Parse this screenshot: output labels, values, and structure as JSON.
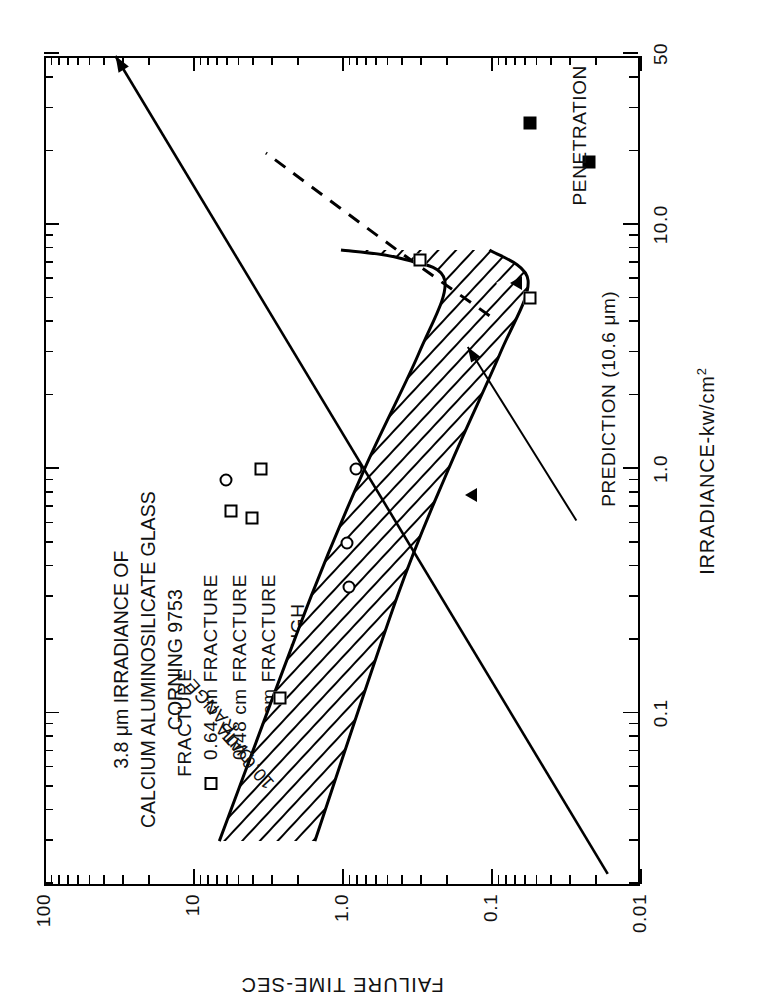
{
  "figure": {
    "title_lines": [
      "3.8 μm IRRADIANCE OF",
      "CALCIUM ALUMINOSILICATE GLASS",
      "CORNING 9753"
    ]
  },
  "legend": {
    "entries": [
      {
        "symbol": "open-square",
        "label": "0.64 cm FRACTURE"
      },
      {
        "symbol": "open-triangle",
        "label": "0.48 cm FRACTURE"
      },
      {
        "symbol": "open-circle",
        "label": "0.25 cm FRACTURE"
      },
      {
        "symbol": "filled-square",
        "label": "BURNTHROUGH"
      }
    ]
  },
  "annotations": {
    "fracture": "FRACTURE",
    "penetration": "PENETRATION",
    "prediction": "PREDICTION (10.6 μm)",
    "band_line1": "10.6 μm",
    "band_line2": "DATA",
    "band_line3": "RANGE"
  },
  "chart_data": {
    "type": "scatter",
    "title": "3.8 μm IRRADIANCE OF CALCIUM ALUMINOSILICATE GLASS CORNING 9753",
    "xlabel": "IRRADIANCE-kw/cm2",
    "ylabel": "FAILURE TIME-SEC",
    "xscale": "log",
    "yscale": "log",
    "xlim": [
      0.02,
      50
    ],
    "ylim": [
      0.01,
      100
    ],
    "xticklabels": [
      "0.1",
      "1.0",
      "10.0",
      "50"
    ],
    "xtickvalues": [
      0.1,
      1.0,
      10.0,
      50
    ],
    "yticklabels": [
      "100",
      "10",
      "1.0",
      "0.1",
      "0.01"
    ],
    "ytickvalues": [
      100,
      10,
      1.0,
      0.1,
      0.01
    ],
    "grid": false,
    "legend_position": "upper-left",
    "series": [
      {
        "name": "0.64 cm FRACTURE",
        "symbol": "open-square",
        "points": [
          {
            "x": 0.115,
            "y": 2.6
          },
          {
            "x": 0.63,
            "y": 4.0
          },
          {
            "x": 0.67,
            "y": 5.6
          },
          {
            "x": 1.0,
            "y": 3.5
          },
          {
            "x": 7.2,
            "y": 0.3
          },
          {
            "x": 5.0,
            "y": 0.055
          }
        ]
      },
      {
        "name": "0.48 cm FRACTURE",
        "symbol": "open-triangle",
        "points": [
          {
            "x": 0.78,
            "y": 0.17
          },
          {
            "x": 5.8,
            "y": 0.085
          }
        ]
      },
      {
        "name": "0.25 cm FRACTURE",
        "symbol": "open-circle",
        "points": [
          {
            "x": 0.33,
            "y": 0.9
          },
          {
            "x": 0.5,
            "y": 0.92
          },
          {
            "x": 0.9,
            "y": 6.0
          },
          {
            "x": 1.0,
            "y": 0.8
          }
        ]
      },
      {
        "name": "BURNTHROUGH",
        "symbol": "filled-square",
        "points": [
          {
            "x": 26.0,
            "y": 0.055
          },
          {
            "x": 18.0,
            "y": 0.022
          }
        ]
      }
    ],
    "curves": [
      {
        "name": "FRACTURE",
        "style": "solid",
        "points": [
          {
            "x": 0.022,
            "y": 0.016
          },
          {
            "x": 50,
            "y": 33
          }
        ]
      },
      {
        "name": "PENETRATION",
        "style": "dashed",
        "points": [
          {
            "x": 4.3,
            "y": 0.1
          },
          {
            "x": 8.0,
            "y": 0.42
          },
          {
            "x": 20.0,
            "y": 3.2
          }
        ]
      },
      {
        "name": "10.6 μm DATA RANGE upper bound",
        "style": "solid",
        "points": [
          {
            "x": 0.03,
            "y": 6.6
          },
          {
            "x": 0.3,
            "y": 1.6
          },
          {
            "x": 1.0,
            "y": 0.7
          },
          {
            "x": 3.0,
            "y": 0.3
          },
          {
            "x": 6.0,
            "y": 0.2
          },
          {
            "x": 7.4,
            "y": 0.4
          },
          {
            "x": 8.0,
            "y": 1.0
          }
        ]
      },
      {
        "name": "10.6 μm DATA RANGE lower bound",
        "style": "solid",
        "points": [
          {
            "x": 0.03,
            "y": 1.5
          },
          {
            "x": 0.3,
            "y": 0.42
          },
          {
            "x": 1.0,
            "y": 0.19
          },
          {
            "x": 3.0,
            "y": 0.085
          },
          {
            "x": 6.0,
            "y": 0.055
          },
          {
            "x": 8.0,
            "y": 0.1
          }
        ]
      }
    ]
  }
}
